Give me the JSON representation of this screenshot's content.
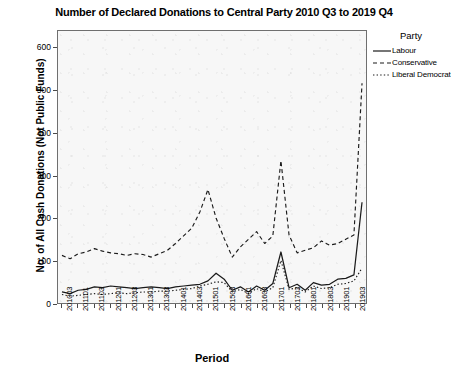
{
  "chart_data": {
    "type": "line",
    "title": "Number of Declared Donations to Central Party 2010 Q3 to 2019 Q4",
    "xlabel": "Period",
    "ylabel": "No. of All Cash Donations (Not Public Funds)",
    "legend_title": "Party",
    "legend_position": "right",
    "grid": false,
    "ylim": [
      0,
      640
    ],
    "yticks": [
      0,
      100,
      200,
      300,
      400,
      500,
      600
    ],
    "ytick_labels": [
      "0",
      "100",
      "200",
      "300",
      "400",
      "500",
      "600"
    ],
    "xtick_labels": [
      "201003",
      "201101",
      "201103",
      "201201",
      "201203",
      "201301",
      "201303",
      "201401",
      "201403",
      "201501",
      "201503",
      "201601",
      "201603",
      "201701",
      "201703",
      "201801",
      "201803",
      "201901",
      "201903"
    ],
    "x": [
      "201003",
      "201004",
      "201101",
      "201102",
      "201103",
      "201104",
      "201201",
      "201202",
      "201203",
      "201204",
      "201301",
      "201302",
      "201303",
      "201304",
      "201401",
      "201402",
      "201403",
      "201404",
      "201501",
      "201502",
      "201503",
      "201504",
      "201601",
      "201602",
      "201603",
      "201604",
      "201701",
      "201702",
      "201703",
      "201704",
      "201801",
      "201802",
      "201803",
      "201804",
      "201901",
      "201902",
      "201903",
      "201904"
    ],
    "series": [
      {
        "name": "Labour",
        "style": "solid",
        "color": "#1a1a1a",
        "values": [
          26,
          22,
          30,
          32,
          38,
          36,
          40,
          38,
          36,
          34,
          36,
          38,
          36,
          34,
          38,
          40,
          42,
          44,
          52,
          70,
          56,
          30,
          38,
          26,
          40,
          30,
          46,
          120,
          36,
          44,
          30,
          48,
          42,
          44,
          56,
          58,
          66,
          237
        ]
      },
      {
        "name": "Conservative",
        "style": "dashed",
        "color": "#1a1a1a",
        "values": [
          112,
          104,
          116,
          120,
          128,
          122,
          118,
          116,
          112,
          116,
          114,
          108,
          116,
          124,
          140,
          158,
          176,
          214,
          267,
          200,
          152,
          108,
          132,
          150,
          168,
          140,
          158,
          335,
          160,
          118,
          124,
          130,
          146,
          136,
          140,
          150,
          160,
          517
        ]
      },
      {
        "name": "Liberal Democrat",
        "style": "dotted",
        "color": "#1a1a1a",
        "values": [
          20,
          16,
          18,
          20,
          22,
          20,
          22,
          24,
          22,
          24,
          26,
          26,
          28,
          28,
          30,
          32,
          34,
          40,
          44,
          50,
          48,
          26,
          32,
          22,
          34,
          26,
          36,
          100,
          32,
          36,
          26,
          40,
          34,
          36,
          44,
          46,
          52,
          82
        ]
      }
    ]
  }
}
